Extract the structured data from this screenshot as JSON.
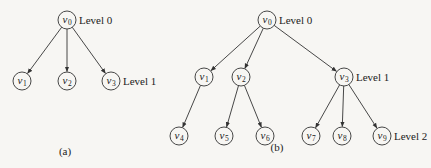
{
  "figure": {
    "subfigures": [
      {
        "caption": "(a)",
        "caption_pos": [
          65,
          155
        ],
        "nodes": [
          {
            "id": "v0",
            "base": "v",
            "sub": "0",
            "x": 67,
            "y": 20,
            "level_label": "Level 0"
          },
          {
            "id": "v1",
            "base": "v",
            "sub": "1",
            "x": 22,
            "y": 81
          },
          {
            "id": "v2",
            "base": "v",
            "sub": "2",
            "x": 67,
            "y": 81
          },
          {
            "id": "v3",
            "base": "v",
            "sub": "3",
            "x": 111,
            "y": 81,
            "level_label": "Level 1"
          }
        ],
        "edges": [
          [
            "v0",
            "v1"
          ],
          [
            "v0",
            "v2"
          ],
          [
            "v0",
            "v3"
          ]
        ]
      },
      {
        "caption": "(b)",
        "caption_pos": [
          277,
          151
        ],
        "nodes": [
          {
            "id": "v0",
            "base": "v",
            "sub": "0",
            "x": 267,
            "y": 20,
            "level_label": "Level 0"
          },
          {
            "id": "v1",
            "base": "v",
            "sub": "1",
            "x": 204,
            "y": 77
          },
          {
            "id": "v2",
            "base": "v",
            "sub": "2",
            "x": 241,
            "y": 77
          },
          {
            "id": "v3",
            "base": "v",
            "sub": "3",
            "x": 344,
            "y": 77,
            "level_label": "Level 1"
          },
          {
            "id": "v4",
            "base": "v",
            "sub": "4",
            "x": 179,
            "y": 136
          },
          {
            "id": "v5",
            "base": "v",
            "sub": "5",
            "x": 224,
            "y": 136
          },
          {
            "id": "v6",
            "base": "v",
            "sub": "6",
            "x": 265,
            "y": 136
          },
          {
            "id": "v7",
            "base": "v",
            "sub": "7",
            "x": 311,
            "y": 136
          },
          {
            "id": "v8",
            "base": "v",
            "sub": "8",
            "x": 342,
            "y": 136
          },
          {
            "id": "v9",
            "base": "v",
            "sub": "9",
            "x": 382,
            "y": 136,
            "level_label": "Level 2"
          }
        ],
        "edges": [
          [
            "v0",
            "v1"
          ],
          [
            "v0",
            "v2"
          ],
          [
            "v0",
            "v3"
          ],
          [
            "v1",
            "v4"
          ],
          [
            "v2",
            "v5"
          ],
          [
            "v2",
            "v6"
          ],
          [
            "v3",
            "v7"
          ],
          [
            "v3",
            "v8"
          ],
          [
            "v3",
            "v9"
          ]
        ]
      }
    ],
    "node_radius": 9,
    "colors": {
      "stroke": "#333333",
      "background": "#f7f6f3",
      "text": "#222222"
    }
  }
}
